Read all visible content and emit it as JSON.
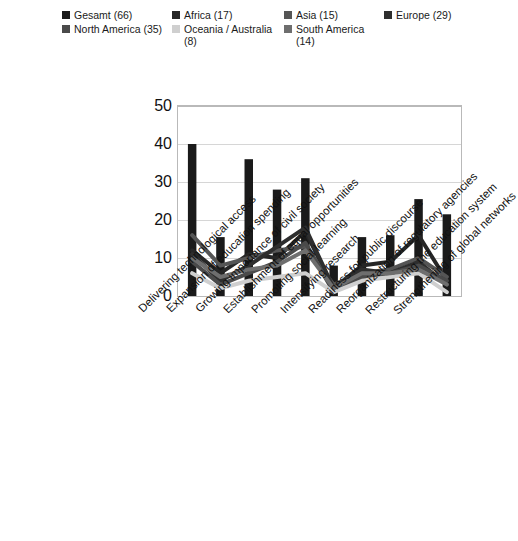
{
  "legend": {
    "rows": [
      [
        {
          "label": "Gesamt (66)",
          "color": "#1a1a1a",
          "name": "legend-item-gesamt"
        },
        {
          "label": "Africa (17)",
          "color": "#262626",
          "name": "legend-item-africa"
        },
        {
          "label": "Asia (15)",
          "color": "#555555",
          "name": "legend-item-asia"
        },
        {
          "label": "Europe (29)",
          "color": "#2e2e2e",
          "name": "legend-item-europe"
        }
      ],
      [
        {
          "label": "North America (35)",
          "color": "#4a4a4a",
          "name": "legend-item-north-america"
        },
        {
          "label": "Oceania / Australia (8)",
          "color": "#cfcfcf",
          "name": "legend-item-oceania-australia"
        },
        {
          "label": "South America (14)",
          "color": "#6e6e6e",
          "name": "legend-item-south-america"
        }
      ]
    ]
  },
  "chart_data": {
    "type": "bar",
    "title": "",
    "subtitle": "",
    "xlabel": "",
    "ylabel": "",
    "ylim": [
      0,
      50
    ],
    "yticks": [
      0,
      10,
      20,
      30,
      40,
      50
    ],
    "grid": true,
    "legend_position": "top",
    "categories": [
      "Delivering technological access",
      "Expansion of education spending",
      "Growing importance of civil society",
      "Establishment of equal opportunities",
      "Promoting social learning",
      "Intensifying research",
      "Readiness for public discourse",
      "Reorganization of regulatory agencies",
      "Restructuring the education system",
      "Strengthening of global networks"
    ],
    "series": [
      {
        "name": "Gesamt (66)",
        "type": "bar",
        "color": "#1a1a1a",
        "values": [
          40,
          15.5,
          36,
          28,
          31,
          8,
          15.5,
          16,
          25.5,
          21.5
        ]
      },
      {
        "name": "Africa (17)",
        "type": "line",
        "color": "#262626",
        "values": [
          12,
          6,
          11,
          10,
          17,
          2,
          8,
          9,
          16,
          4
        ]
      },
      {
        "name": "Asia (15)",
        "type": "line",
        "color": "#555555",
        "values": [
          16,
          8,
          10,
          12,
          13,
          3,
          6,
          7,
          10,
          5
        ]
      },
      {
        "name": "Europe (29)",
        "type": "line",
        "color": "#2e2e2e",
        "values": [
          11,
          4,
          8,
          13,
          18,
          2,
          7,
          6,
          9,
          3
        ]
      },
      {
        "name": "North America (35)",
        "type": "line",
        "color": "#4a4a4a",
        "values": [
          9,
          3,
          6,
          9,
          14,
          1,
          5,
          6,
          8,
          4
        ]
      },
      {
        "name": "Oceania / Australia (8)",
        "type": "line",
        "color": "#cfcfcf",
        "values": [
          6,
          2,
          4,
          5,
          6,
          1,
          4,
          5,
          6,
          1
        ]
      },
      {
        "name": "South America (14)",
        "type": "line",
        "color": "#6e6e6e",
        "values": [
          10,
          5,
          7,
          8,
          12,
          2,
          6,
          6,
          7,
          3
        ]
      }
    ]
  }
}
